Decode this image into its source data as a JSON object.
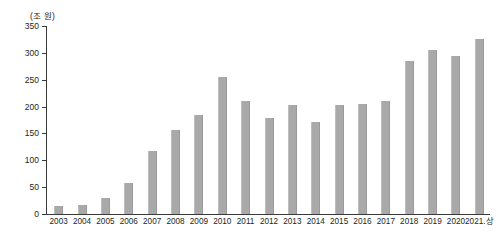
{
  "chart_data": {
    "type": "bar",
    "title": "",
    "subtitle": "",
    "unit_label": "(조 원)",
    "xlabel": "",
    "ylabel": "",
    "ylim": [
      0,
      350
    ],
    "ytick_step": 50,
    "yticks": [
      "0",
      "50",
      "100",
      "150",
      "200",
      "250",
      "300",
      "350"
    ],
    "grid": false,
    "legend": false,
    "legend_position": "none",
    "bar_color": "#a9a9a9",
    "axis_color": "#3a3a3a",
    "text_color": "#231f20",
    "categories": [
      "2003",
      "2004",
      "2005",
      "2006",
      "2007",
      "2008",
      "2009",
      "2010",
      "2011",
      "2012",
      "2013",
      "2014",
      "2015",
      "2016",
      "2017",
      "2018",
      "2019",
      "2020",
      "2021.상"
    ],
    "values": [
      15,
      17,
      29,
      57,
      117,
      156,
      184,
      255,
      211,
      179,
      203,
      172,
      203,
      205,
      211,
      285,
      306,
      294,
      326
    ]
  }
}
